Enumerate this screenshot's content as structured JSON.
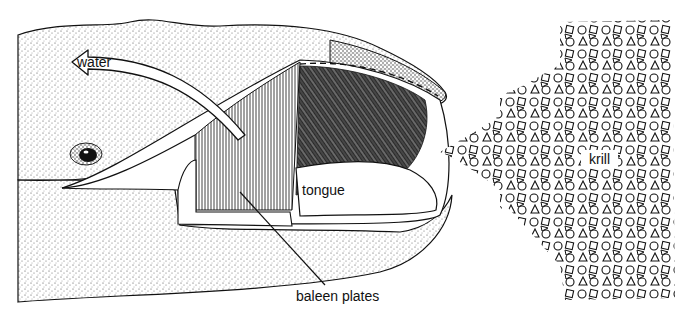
{
  "figure": {
    "labels": {
      "water": "water",
      "tongue": "tongue",
      "baleen_plates": "baleen plates",
      "krill": "krill"
    },
    "colors": {
      "ink": "#111111",
      "background": "#ffffff",
      "stipple": "#555555"
    },
    "icons": {
      "water_arrow": "arrow-left-icon",
      "eye": "eye-icon",
      "krill_pattern": "shapes-pattern-icon"
    }
  }
}
